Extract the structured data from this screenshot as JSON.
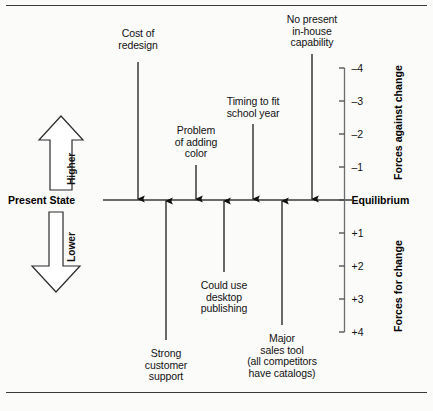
{
  "diagram": {
    "type": "force-field-analysis",
    "baseline_label": "Present State",
    "equilibrium_label": "Equilibrium",
    "axis_top_label": "Forces against change",
    "axis_bottom_label": "Forces for change",
    "direction_up_label": "Higher",
    "direction_down_label": "Lower"
  },
  "axis": {
    "ticks": [
      {
        "label": "–4",
        "value": -4,
        "y": 68
      },
      {
        "label": "–3",
        "value": -3,
        "y": 101
      },
      {
        "label": "–2",
        "value": -2,
        "y": 134
      },
      {
        "label": "–1",
        "value": -1,
        "y": 167
      },
      {
        "label": "Equilibrium",
        "value": 0,
        "y": 200
      },
      {
        "label": "+1",
        "value": 1,
        "y": 233
      },
      {
        "label": "+2",
        "value": 2,
        "y": 266
      },
      {
        "label": "+3",
        "value": 3,
        "y": 299
      },
      {
        "label": "+4",
        "value": 4,
        "y": 332
      }
    ]
  },
  "forces_against": [
    {
      "label": "Cost of\nredesign",
      "x": 138,
      "label_y": 28,
      "shaft_top": 62
    },
    {
      "label": "Problem\nof adding\ncolor",
      "x": 196,
      "label_y": 125,
      "shaft_top": 165
    },
    {
      "label": "Timing to fit\nschool year",
      "x": 253,
      "label_y": 96,
      "shaft_top": 124
    },
    {
      "label": "No present\nin-house\ncapability",
      "x": 312,
      "label_y": 14,
      "shaft_top": 54
    }
  ],
  "forces_for": [
    {
      "label": "Strong\ncustomer\nsupport",
      "x": 166,
      "label_y": 348,
      "shaft_bottom": 340
    },
    {
      "label": "Could use\ndesktop\npublishing",
      "x": 224,
      "label_y": 280,
      "shaft_bottom": 272
    },
    {
      "label": "Major\nsales tool\n(all competitors\nhave catalogs)",
      "x": 282,
      "label_y": 333,
      "shaft_bottom": 325
    }
  ],
  "colors": {
    "line": "#3a3a3a",
    "arrow": "#111111",
    "text": "#111111",
    "background": "#fbfbfa"
  }
}
